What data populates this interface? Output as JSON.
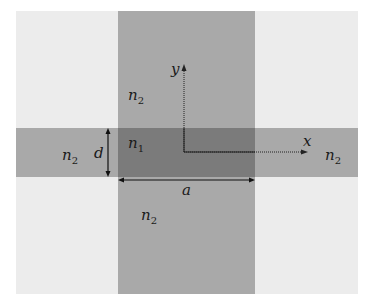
{
  "diagram": {
    "title": "",
    "regions": {
      "outer": {
        "color": "#ececec"
      },
      "cladding_bands": {
        "color": "#a9a9a9"
      },
      "core": {
        "color": "#7b7b7b"
      }
    },
    "labels": {
      "n2_top": {
        "base": "n",
        "sub": "2"
      },
      "n1_core": {
        "base": "n",
        "sub": "1"
      },
      "n2_left": {
        "base": "n",
        "sub": "2"
      },
      "n2_right": {
        "base": "n",
        "sub": "2"
      },
      "n2_bottom": {
        "base": "n",
        "sub": "2"
      },
      "d": "d",
      "a": "a",
      "x_axis": "x",
      "y_axis": "y"
    }
  }
}
